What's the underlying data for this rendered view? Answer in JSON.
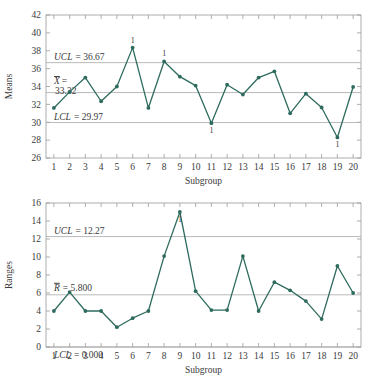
{
  "chart_data": [
    {
      "type": "line",
      "name": "xbar-chart",
      "title": "",
      "xlabel": "Subgroup",
      "ylabel": "Means",
      "x": [
        1,
        2,
        3,
        4,
        5,
        6,
        7,
        8,
        9,
        10,
        11,
        12,
        13,
        14,
        15,
        16,
        17,
        18,
        19,
        20
      ],
      "categories": [
        "1",
        "2",
        "3",
        "4",
        "5",
        "6",
        "7",
        "8",
        "9",
        "10",
        "11",
        "12",
        "13",
        "14",
        "15",
        "16",
        "17",
        "18",
        "19",
        "20"
      ],
      "values": [
        31.6,
        33.4,
        35.0,
        32.35,
        34.0,
        38.35,
        31.6,
        36.8,
        35.1,
        34.1,
        29.9,
        34.2,
        33.1,
        35.0,
        35.7,
        31.0,
        33.2,
        31.65,
        28.3,
        33.95
      ],
      "ylim": [
        26,
        42
      ],
      "yticks": [
        26,
        28,
        30,
        32,
        34,
        36,
        38,
        40,
        42
      ],
      "xlim": [
        0.5,
        20.5
      ],
      "grid": false,
      "series_color": "#2e6b5e",
      "control_limits": {
        "ucl": {
          "value": 36.67,
          "label": "UCL",
          "text": "UCL = 36.67"
        },
        "center": {
          "value": 33.32,
          "label": "X̄",
          "text_line1": "=",
          "text_line2": "33.32",
          "symbol": "X"
        },
        "lcl": {
          "value": 29.97,
          "label": "LCL",
          "text": "LCL = 29.97"
        }
      },
      "violations": [
        {
          "subgroup": 6,
          "label": "1",
          "position": "above"
        },
        {
          "subgroup": 8,
          "label": "1",
          "position": "above"
        },
        {
          "subgroup": 11,
          "label": "1",
          "position": "below"
        },
        {
          "subgroup": 19,
          "label": "1",
          "position": "below"
        }
      ]
    },
    {
      "type": "line",
      "name": "range-chart",
      "title": "",
      "xlabel": "Subgroup",
      "ylabel": "Ranges",
      "x": [
        1,
        2,
        3,
        4,
        5,
        6,
        7,
        8,
        9,
        10,
        11,
        12,
        13,
        14,
        15,
        16,
        17,
        18,
        19,
        20
      ],
      "categories": [
        "1",
        "2",
        "3",
        "4",
        "5",
        "6",
        "7",
        "8",
        "9",
        "10",
        "11",
        "12",
        "13",
        "14",
        "15",
        "16",
        "17",
        "18",
        "19",
        "20"
      ],
      "values": [
        4.0,
        6.1,
        4.0,
        4.0,
        2.2,
        3.2,
        4.0,
        10.1,
        15.0,
        6.2,
        4.1,
        4.1,
        10.1,
        4.0,
        7.2,
        6.3,
        5.1,
        3.1,
        9.0,
        6.0
      ],
      "ylim": [
        0,
        16
      ],
      "yticks": [
        0,
        2,
        4,
        6,
        8,
        10,
        12,
        14,
        16
      ],
      "xlim": [
        0.5,
        20.5
      ],
      "grid": false,
      "series_color": "#2e6b5e",
      "control_limits": {
        "ucl": {
          "value": 12.27,
          "label": "UCL",
          "text": "UCL = 12.27"
        },
        "center": {
          "value": 5.8,
          "label": "R̄",
          "text": "= 5.800",
          "symbol": "R"
        },
        "lcl": {
          "value": 0.0,
          "label": "LCL",
          "text": "LCL = 0.000"
        }
      },
      "violations": [
        {
          "subgroup": 9,
          "label": "1",
          "position": "below"
        }
      ]
    }
  ]
}
